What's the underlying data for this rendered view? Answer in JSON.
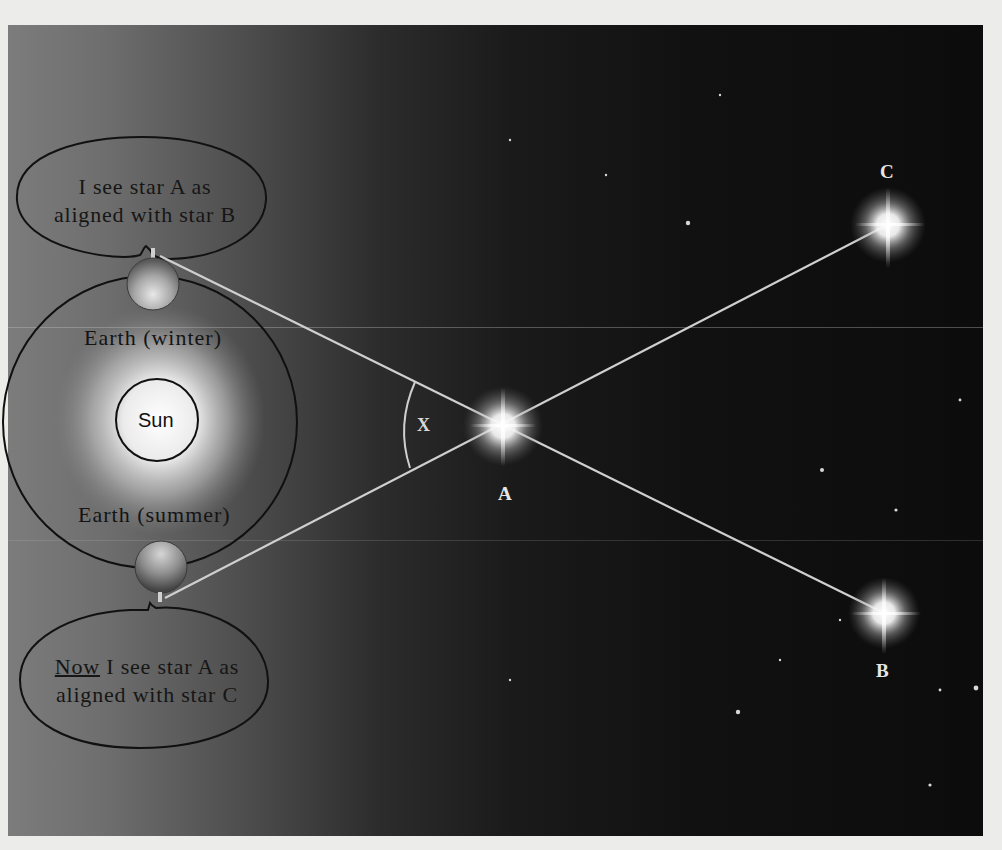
{
  "diagram": {
    "bubbles": {
      "winter": {
        "line1": "I see star A as",
        "line2": "aligned with star B"
      },
      "summer": {
        "emphasis": "Now",
        "line1_rest": " I see star A as",
        "line2": "aligned with star C"
      }
    },
    "labels": {
      "earth_winter": "Earth (winter)",
      "earth_summer": "Earth (summer)",
      "sun": "Sun",
      "angle": "X"
    },
    "stars": [
      {
        "id": "A",
        "label": "A"
      },
      {
        "id": "B",
        "label": "B"
      },
      {
        "id": "C",
        "label": "C"
      }
    ],
    "colors": {
      "panel_left": "#7c7c7c",
      "panel_right": "#0c0c0c",
      "sight_line": "#cfcfcf",
      "outline": "#101010",
      "page": "#ececea"
    }
  }
}
